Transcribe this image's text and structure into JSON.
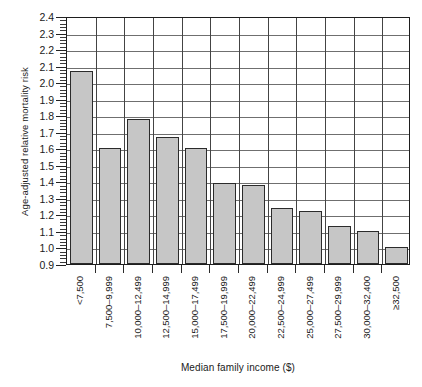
{
  "chart_data": {
    "type": "bar",
    "title": "",
    "xlabel": "Median family income ($)",
    "ylabel": "Age-adjusted relative mortality risk",
    "ylim": [
      0.9,
      2.4
    ],
    "ytick_step": 0.1,
    "yticks": [
      "2.4",
      "2.3",
      "2.2",
      "2.1",
      "2.0",
      "1.9",
      "1.8",
      "1.7",
      "1.6",
      "1.5",
      "1.4",
      "1.3",
      "1.2",
      "1.1",
      "1.0",
      "0.9"
    ],
    "grid": "both",
    "legend": "none",
    "bar_fill_color": "#c6c6c6",
    "bar_edge_color": "#2b2b2b",
    "categories": [
      "<7,500",
      "7,500–9,999",
      "10,000–12,499",
      "12,500–14,999",
      "15,000–17,499",
      "17,500–19,999",
      "20,000–22,499",
      "22,500–24,999",
      "25,000–27,499",
      "27,500–29,999",
      "30,000–32,400",
      "≥32,500"
    ],
    "values": [
      2.07,
      1.6,
      1.78,
      1.67,
      1.6,
      1.39,
      1.38,
      1.24,
      1.22,
      1.13,
      1.1,
      1.0
    ]
  }
}
